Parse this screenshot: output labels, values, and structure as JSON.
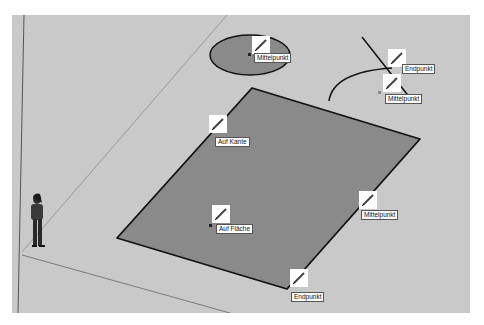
{
  "app": {
    "name": "3D modeling viewport"
  },
  "colors": {
    "background": "#c9c9c9",
    "face": "#8a8a8a",
    "edge": "#111111",
    "axis": "#7a7a7a",
    "tooltip_bg": "#ffffff"
  },
  "snap_icons": [
    "pencil-icon"
  ],
  "inference_tooltips": {
    "circle_center": "Mittelpunkt",
    "line_endpoint": "Endpunkt",
    "arc_center": "Mittelpunkt",
    "on_edge": "Auf Kante",
    "on_face": "Auf Fläche",
    "edge_midpoint": "Mittelpunkt",
    "rect_endpoint": "Endpunkt"
  },
  "scene": {
    "rectangle": {
      "points": [
        [
          252,
          88
        ],
        [
          420,
          139
        ],
        [
          287,
          289
        ],
        [
          117,
          238
        ]
      ]
    },
    "ellipse": {
      "cx": 250,
      "cy": 55,
      "rx": 40,
      "ry": 20
    },
    "line": {
      "from": [
        362,
        37
      ],
      "to": [
        414,
        103
      ]
    },
    "arc": {
      "from": [
        328,
        100
      ],
      "to": [
        392,
        68
      ]
    }
  }
}
